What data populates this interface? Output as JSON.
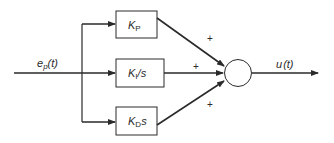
{
  "diagram": {
    "type": "PID controller block diagram",
    "input": {
      "label": "e",
      "subscript": "p",
      "arg": "(t)"
    },
    "output": {
      "label": "u",
      "arg": "(t)"
    },
    "blocks": [
      {
        "id": "proportional",
        "main": "K",
        "subscript": "P",
        "suffix": ""
      },
      {
        "id": "integral",
        "main": "K",
        "subscript": "I",
        "suffix": "/s"
      },
      {
        "id": "derivative",
        "main": "K",
        "subscript": "D",
        "suffix": "s"
      }
    ],
    "summing_junction": {
      "signs": [
        "+",
        "+",
        "+"
      ]
    },
    "colors": {
      "line": "#2a2a2a",
      "background": "#ffffff"
    }
  }
}
